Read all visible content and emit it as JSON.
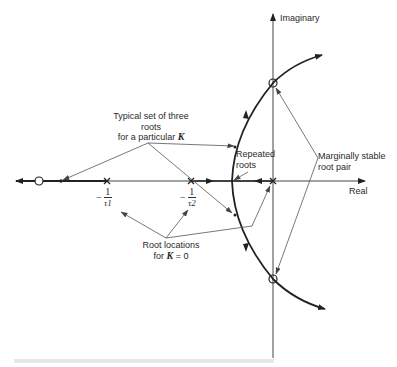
{
  "diagram": {
    "type": "root-locus",
    "axes": {
      "imaginary_label": "Imaginary",
      "real_label": "Real"
    },
    "poles": [
      {
        "name": "origin",
        "label": ""
      },
      {
        "name": "tau2",
        "label_num": "1",
        "label_den": "τ2",
        "label_sign": "−"
      },
      {
        "name": "tau1",
        "label_num": "1",
        "label_den": "τ1",
        "label_sign": "−"
      }
    ],
    "zero": {
      "marker": "circle"
    },
    "annotations": {
      "typical_roots": {
        "line1": "Typical set of three",
        "line2": "roots",
        "line3_prefix": "for a particular ",
        "line3_var": "K"
      },
      "repeated_roots": {
        "line1": "Repeated",
        "line2": "roots"
      },
      "marginally_stable": {
        "line1": "Marginally stable",
        "line2": "root pair"
      },
      "root_locations_k0": {
        "line1": "Root locations",
        "line2_prefix": "for ",
        "line2_var": "K",
        "line2_suffix": " = 0"
      }
    },
    "colors": {
      "ink": "#222222",
      "thin_line": "#555555",
      "background": "#ffffff"
    }
  }
}
